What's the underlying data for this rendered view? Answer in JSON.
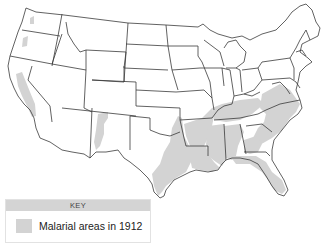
{
  "map": {
    "title": "",
    "region": "United States (contiguous)",
    "shading_color": "#d3d3d3",
    "border_color": "#333333"
  },
  "key": {
    "header": "KEY",
    "items": [
      {
        "label": "Malarial areas in 1912",
        "color": "#d3d3d3"
      }
    ]
  }
}
